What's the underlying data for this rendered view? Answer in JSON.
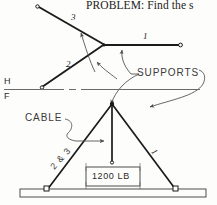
{
  "figure": {
    "heading": "PROBLEM:  Find the s",
    "reference_line": {
      "upper_label": "H",
      "lower_label": "F"
    },
    "top_view": {
      "member_labels": [
        "3",
        "2",
        "1"
      ],
      "callout": "SUPPORTS"
    },
    "front_view": {
      "cable_callout": "CABLE",
      "legs_label": "2 & 3",
      "right_leg_label": "1",
      "load_label": "1200 LB"
    },
    "colors": {
      "ink": "#1b1b1b",
      "light_ink": "#555555",
      "paper": "#fdfdfb"
    }
  }
}
